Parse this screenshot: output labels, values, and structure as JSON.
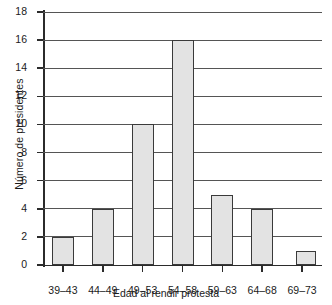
{
  "chart_data": {
    "type": "bar",
    "title": "",
    "subtitle": "",
    "xlabel": "Edad al rendir protesta",
    "ylabel": "Número de presidentes",
    "categories": [
      "39–43",
      "44–49",
      "49–53",
      "54–58",
      "59–63",
      "64–68",
      "69–73"
    ],
    "values": [
      2,
      4,
      10,
      16,
      5,
      4,
      1
    ],
    "ylim": [
      0,
      18
    ],
    "ytick_labels": [
      "0",
      "2",
      "4",
      "6",
      "8",
      "10",
      "12",
      "14",
      "16",
      "18"
    ],
    "ytick_values": [
      0,
      2,
      4,
      6,
      8,
      10,
      12,
      14,
      16,
      18
    ],
    "ystep": 2,
    "grid": "horizontal",
    "legend": "none",
    "bar_fill_color": "#e3e3e3",
    "bar_border_color": "#3a3a3a",
    "axis_color": "#2b2b2b",
    "grid_color": "#555555",
    "background_color": "#ffffff",
    "annotations": []
  }
}
